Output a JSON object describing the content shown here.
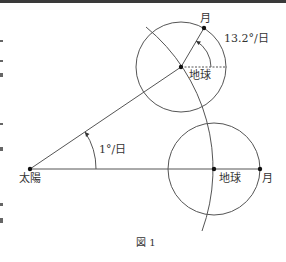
{
  "figure": {
    "caption": "図 1",
    "labels": {
      "sun": "太陽",
      "earth_top": "地球",
      "moon_top": "月",
      "earth_bottom": "地球",
      "moon_bottom": "月",
      "moon_rate": "13.2°/日",
      "earth_rate": "1°/日"
    },
    "colors": {
      "line": "#444444",
      "background": "#ffffff"
    }
  }
}
